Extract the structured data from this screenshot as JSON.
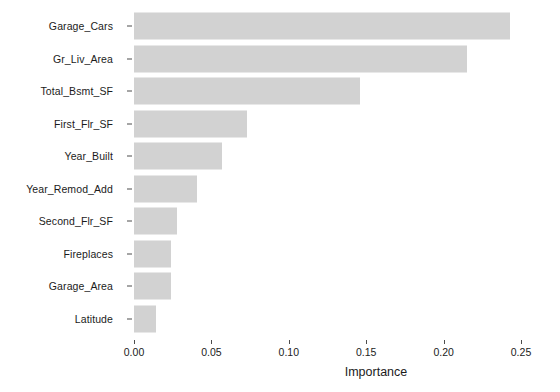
{
  "chart_data": {
    "type": "bar",
    "orientation": "horizontal",
    "title": "",
    "subtitle": "",
    "xlabel": "Importance",
    "ylabel": "",
    "xlim": [
      0.0,
      0.2565
    ],
    "xticks": [
      0.0,
      0.05,
      0.1,
      0.15,
      0.2,
      0.25
    ],
    "xticklabels": [
      "0.00",
      "0.05",
      "0.10",
      "0.15",
      "0.20",
      "0.25"
    ],
    "grid": false,
    "legend": false,
    "legend_position": "none",
    "bar_color": "#d2d2d2",
    "background_color": "#ffffff",
    "text_color": "#1b1b1b",
    "categories": [
      "Garage_Cars",
      "Gr_Liv_Area",
      "Total_Bsmt_SF",
      "First_Flr_SF",
      "Year_Built",
      "Year_Remod_Add",
      "Second_Flr_SF",
      "Fireplaces",
      "Garage_Area",
      "Latitude"
    ],
    "values": [
      0.243,
      0.215,
      0.146,
      0.073,
      0.057,
      0.041,
      0.028,
      0.024,
      0.024,
      0.014
    ],
    "bars": [
      {
        "label": "Garage_Cars",
        "value": 0.243
      },
      {
        "label": "Gr_Liv_Area",
        "value": 0.215
      },
      {
        "label": "Total_Bsmt_SF",
        "value": 0.146
      },
      {
        "label": "First_Flr_SF",
        "value": 0.073
      },
      {
        "label": "Year_Built",
        "value": 0.057
      },
      {
        "label": "Year_Remod_Add",
        "value": 0.041
      },
      {
        "label": "Second_Flr_SF",
        "value": 0.028
      },
      {
        "label": "Fireplaces",
        "value": 0.024
      },
      {
        "label": "Garage_Area",
        "value": 0.024
      },
      {
        "label": "Latitude",
        "value": 0.014
      }
    ]
  }
}
